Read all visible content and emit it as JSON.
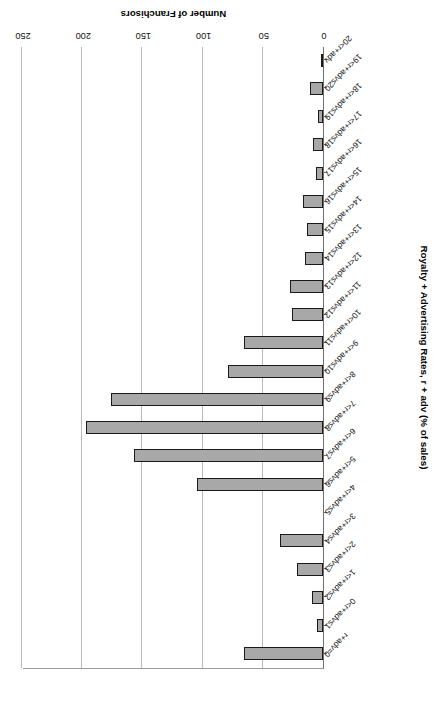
{
  "chart_data": {
    "type": "bar",
    "orientation": "vertical-histogram-rotated-180",
    "title": "",
    "xlabel": "Royalty + Advertising Rates, r + adv (% of sales)",
    "ylabel": "Number of Franchisors",
    "ylim": [
      0,
      250
    ],
    "yticks": [
      0,
      50,
      100,
      150,
      200,
      250
    ],
    "grid": "value-axis-gridlines-on",
    "legend": "none",
    "categories": [
      "r+adv=0",
      "0<r+adv≤1",
      "1<r+adv≤2",
      "2<r+adv≤3",
      "3<r+adv≤4",
      "4<r+adv≤5",
      "5<r+adv≤6",
      "6<r+adv≤7",
      "7<r+adv≤8",
      "8<r+adv≤9",
      "9<r+adv≤10",
      "10<r+adv≤11",
      "11<r+adv≤12",
      "12<r+adv≤13",
      "13<r+adv≤14",
      "14<r+adv≤15",
      "15<r+adv≤16",
      "16<r+adv≤17",
      "17<r+adv≤18",
      "18<r+adv≤19",
      "19<r+adv≤20",
      "20<r+adv"
    ],
    "values": [
      66,
      5,
      9,
      22,
      36,
      0,
      105,
      157,
      197,
      176,
      79,
      66,
      26,
      27,
      15,
      13,
      17,
      6,
      8,
      4,
      11,
      2
    ],
    "bar_color": "#a8a8a8",
    "bar_edge_color": "#1a1a1a",
    "gridline_color": "#b9b9b9",
    "axis_color": "#6f6f6f"
  },
  "axis": {
    "value_tick_labels": [
      "0",
      "50",
      "100",
      "150",
      "200",
      "250"
    ],
    "value_title": "Number of Franchisors",
    "category_title": "Royalty + Advertising Rates, r + adv (% of sales)"
  }
}
